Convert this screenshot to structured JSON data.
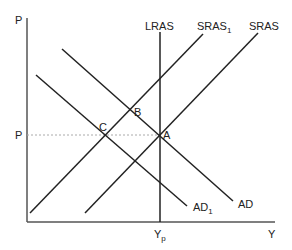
{
  "diagram": {
    "axes": {
      "y_label": "P",
      "x_label": "Y",
      "price_level_label": "P",
      "potential_output_label": "Y",
      "potential_output_sub": "p"
    },
    "curves": {
      "lras": {
        "label": "LRAS"
      },
      "sras1": {
        "label": "SRAS",
        "sub": "1"
      },
      "sras": {
        "label": "SRAS"
      },
      "ad": {
        "label": "AD"
      },
      "ad1": {
        "label": "AD",
        "sub": "1"
      }
    },
    "points": {
      "a": "A",
      "b": "B",
      "c": "C"
    },
    "colors": {
      "line": "#222222",
      "axis": "#555555",
      "dashed": "#aaaaaa"
    }
  }
}
